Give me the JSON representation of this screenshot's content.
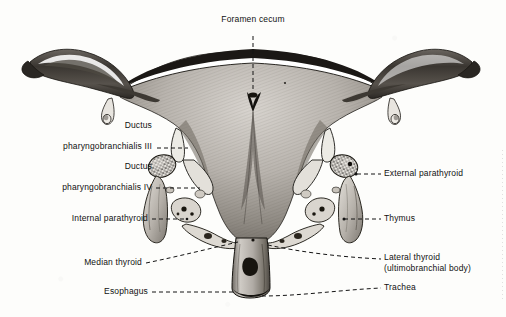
{
  "figure": {
    "title": "Foramen cecum",
    "kind": "anatomical-illustration",
    "background_color": "#fdfdfb",
    "ink_color": "#111111"
  },
  "labels": {
    "foramen_cecum": "Foramen cecum",
    "ductus_iii_line1": "Ductus",
    "ductus_iii_line2": "pharyngobranchialis III",
    "ductus_iv_line1": "Ductus",
    "ductus_iv_line2": "pharyngobranchialis IV",
    "internal_parathyroid": "Internal parathyroid",
    "median_thyroid": "Median thyroid",
    "esophagus": "Esophagus",
    "external_parathyroid": "External parathyroid",
    "thymus": "Thymus",
    "lateral_thyroid_line1": "Lateral thyroid",
    "lateral_thyroid_line2": "(ultimobranchial body)",
    "trachea": "Trachea"
  }
}
